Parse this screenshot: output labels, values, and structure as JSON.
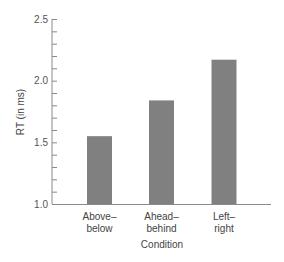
{
  "chart_data": {
    "type": "bar",
    "title": "",
    "xlabel": "Condition",
    "ylabel": "RT (in ms)",
    "categories": [
      "Above–below",
      "Ahead–behind",
      "Left–right"
    ],
    "category_lines": [
      [
        "Above–",
        "below"
      ],
      [
        "Ahead–",
        "behind"
      ],
      [
        "Left–",
        "right"
      ]
    ],
    "values": [
      1.55,
      1.84,
      2.17
    ],
    "ylim": [
      1.0,
      2.5
    ],
    "yticks": [
      1.0,
      1.5,
      2.0,
      2.5
    ],
    "ytick_labels": [
      "1.0",
      "1.5",
      "2.0",
      "2.5"
    ],
    "minor_tick_step": 0.1,
    "grid": false,
    "legend": null,
    "bar_color": "#808080",
    "axis_color": "#8a8a8a"
  }
}
